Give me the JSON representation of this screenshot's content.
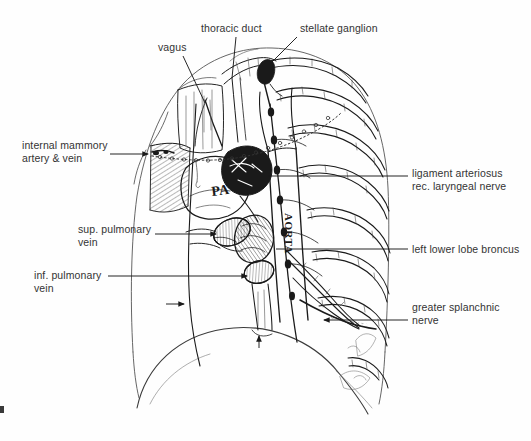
{
  "figure": {
    "medium": "pen-and-ink line drawing with typed annotation labels",
    "background_color": "#fefefe",
    "ink_color": "#1a1a1a",
    "label_color": "#333333",
    "leader_color": "#1a1a1a"
  },
  "labels": [
    {
      "id": "vagus",
      "text": "vagus",
      "x": 158,
      "y": 41,
      "side": "top",
      "leader": {
        "type": "line",
        "x1": 183,
        "y1": 56,
        "x2": 205,
        "y2": 103
      }
    },
    {
      "id": "thoracic-duct",
      "text": "thoracic duct",
      "x": 201,
      "y": 22,
      "side": "top",
      "leader": {
        "type": "line",
        "x1": 236,
        "y1": 37,
        "x2": 232,
        "y2": 78
      }
    },
    {
      "id": "stellate-ganglion",
      "text": "stellate ganglion",
      "x": 300,
      "y": 22,
      "side": "top",
      "leader": {
        "type": "line",
        "x1": 297,
        "y1": 37,
        "x2": 268,
        "y2": 66
      }
    },
    {
      "id": "internal-mammary-artery-vein",
      "text": "internal mammory\nartery & vein",
      "x": 22,
      "y": 139,
      "side": "left",
      "leader": {
        "type": "arrow",
        "x1": 110,
        "y1": 154,
        "x2": 150,
        "y2": 154
      }
    },
    {
      "id": "ligament-arteriosus-rec-laryngeal-nerve",
      "text": "ligament arteriosus\nrec. laryngeal nerve",
      "x": 412,
      "y": 167,
      "side": "right",
      "leader": {
        "type": "line",
        "x1": 408,
        "y1": 176,
        "x2": 268,
        "y2": 176
      }
    },
    {
      "id": "sup-pulmonary-vein",
      "text": "sup. pulmonary\nvein",
      "x": 78,
      "y": 223,
      "side": "left",
      "leader": {
        "type": "arrow",
        "x1": 155,
        "y1": 234,
        "x2": 218,
        "y2": 234
      }
    },
    {
      "id": "left-lower-lobe-bronchus",
      "text": "left lower lobe broncus",
      "x": 412,
      "y": 243,
      "side": "right",
      "leader": {
        "type": "line",
        "x1": 408,
        "y1": 249,
        "x2": 276,
        "y2": 249
      }
    },
    {
      "id": "inf-pulmonary-vein",
      "text": "inf. pulmonary\nvein",
      "x": 34,
      "y": 269,
      "side": "left",
      "leader": {
        "type": "arrow",
        "x1": 108,
        "y1": 276,
        "x2": 249,
        "y2": 276
      }
    },
    {
      "id": "greater-splanchnic-nerve",
      "text": "greater splanchnic\nnerve",
      "x": 412,
      "y": 301,
      "side": "right",
      "leader": {
        "type": "arrow",
        "x1": 408,
        "y1": 320,
        "x2": 322,
        "y2": 320
      }
    }
  ],
  "handwritten_labels": [
    {
      "id": "pa",
      "text": "PA",
      "x": 212,
      "y": 188,
      "rotation": -6,
      "size": 13
    },
    {
      "id": "aorta",
      "text": "AORTA",
      "x": 285,
      "y": 213,
      "rotation": 90,
      "size": 11
    }
  ],
  "unlabeled_markers": [
    {
      "id": "phrenic-nerve-arrow",
      "type": "arrow",
      "x1": 166,
      "y1": 304,
      "x2": 186,
      "y2": 304
    },
    {
      "id": "esophagus-arrow",
      "type": "arrow",
      "x1": 259,
      "y1": 348,
      "x2": 259,
      "y2": 334
    }
  ],
  "anatomy_regions": [
    {
      "id": "chest-wall-outline",
      "description": "left hemithorax silhouette"
    },
    {
      "id": "diaphragm-dome",
      "description": "diaphragm dome at base"
    },
    {
      "id": "rib-cage",
      "description": "posterior rib series, right of field"
    },
    {
      "id": "mediastinal-structures",
      "description": "pulmonary artery, aorta, veins, bronchus"
    },
    {
      "id": "sympathetic-chain",
      "description": "paravertebral sympathetic chain"
    }
  ]
}
